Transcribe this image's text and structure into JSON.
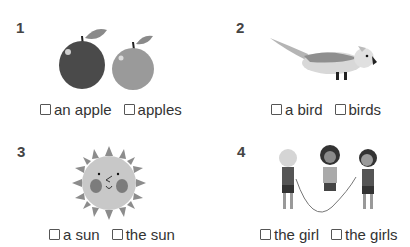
{
  "exercises": [
    {
      "number": "1",
      "image": "two-apples",
      "options": [
        "an apple",
        "apples"
      ]
    },
    {
      "number": "2",
      "image": "bird",
      "options": [
        "a bird",
        "birds"
      ]
    },
    {
      "number": "3",
      "image": "sun",
      "options": [
        "a sun",
        "the sun"
      ]
    },
    {
      "number": "4",
      "image": "girls-jumping-rope",
      "options": [
        "the girl",
        "the girls"
      ]
    }
  ]
}
